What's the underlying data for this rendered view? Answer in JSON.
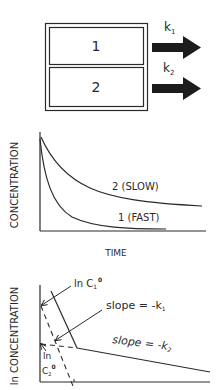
{
  "compartment_diagram": {
    "compartments": [
      {
        "label": "1"
      },
      {
        "label": "2"
      }
    ],
    "arrows": [
      {
        "label": "k",
        "subscript": "1"
      },
      {
        "label": "k",
        "subscript": "2"
      }
    ]
  },
  "linear_plot": {
    "ylabel": "CONCENTRATION",
    "xlabel": "TIME",
    "curves": [
      {
        "label": "2 (SLOW)"
      },
      {
        "label": "1 (FAST)"
      }
    ]
  },
  "log_plot": {
    "ylabel": "ln CONCENTRATION",
    "annotations": {
      "lnC1_prefix": "ln C",
      "lnC1_sub": "1",
      "lnC1_sup": "0",
      "slope1_prefix": "slope = -k",
      "slope1_sub": "1",
      "slope2_prefix": "slope = -k",
      "slope2_sub": "2",
      "lnC2_line1": "ln",
      "lnC2_prefix": "C",
      "lnC2_sub": "2",
      "lnC2_sup": "0"
    }
  },
  "colors": {
    "ink": "#2a2a2a",
    "background": "#ffffff"
  }
}
